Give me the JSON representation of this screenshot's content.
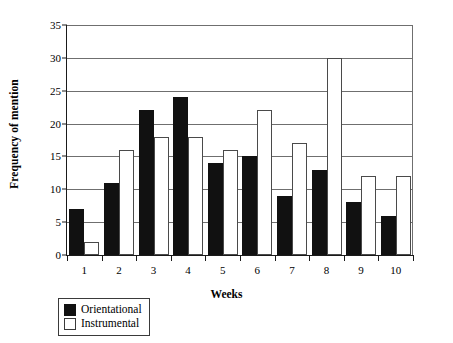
{
  "chart_data": {
    "type": "bar",
    "title": "",
    "xlabel": "Weeks",
    "ylabel": "Frequency of mention",
    "categories": [
      "1",
      "2",
      "3",
      "4",
      "5",
      "6",
      "7",
      "8",
      "9",
      "10"
    ],
    "series": [
      {
        "name": "Orientational",
        "color": "#111111",
        "values": [
          7,
          11,
          22,
          24,
          14,
          15,
          9,
          13,
          8,
          6
        ]
      },
      {
        "name": "Instrumental",
        "color": "#ffffff",
        "values": [
          2,
          16,
          18,
          18,
          16,
          22,
          17,
          30,
          12,
          12
        ]
      }
    ],
    "ylim": [
      0,
      35
    ],
    "ytick_values": [
      0,
      5,
      10,
      15,
      20,
      25,
      30,
      35
    ],
    "ytick_labels": [
      "0",
      "5",
      "10",
      "15",
      "20",
      "25",
      "30",
      "35"
    ],
    "grid": "horizontal",
    "legend_position": "below-left",
    "legend_entries": [
      {
        "label": "Orientational",
        "swatch": "filled-black"
      },
      {
        "label": "Instrumental",
        "swatch": "outlined-white"
      }
    ]
  }
}
